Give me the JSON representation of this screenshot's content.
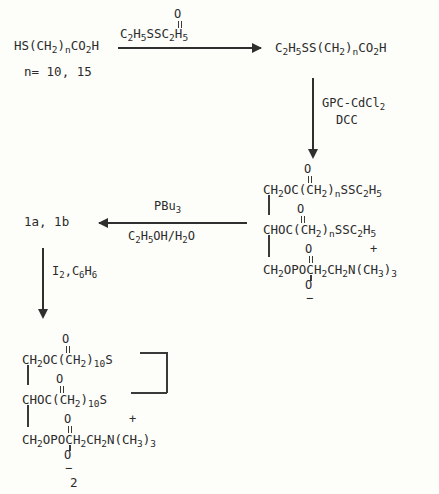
{
  "scheme": {
    "background_color": "#fdfdfa",
    "ink_color": "#2b2b2b",
    "compound_label": "2"
  },
  "step1": {
    "reactant": "HS(CH₂)ₙCO₂H",
    "reactant_note": "n= 10, 15",
    "reagent_above": "C₂H₅SSC₂H₅",
    "reagent_above_carbonyl": "O",
    "product": "C₂H₅SS(CH₂)ₙCO₂H",
    "arrow": "right-arrow"
  },
  "step2": {
    "reagent_line1": "GPC-CdCl₂",
    "reagent_line2": "DCC",
    "arrow": "down-arrow"
  },
  "intermediate": {
    "line1": "CH₂OC(CH₂)ₙSSC₂H₅",
    "line1_carbonyl": "O",
    "line2": "CHOC(CH₂)ₙSSC₂H₅",
    "line2_carbonyl": "O",
    "line3": "CH₂OPOCH₂CH₂N(CH₃)₃",
    "line3_top_o": "O",
    "line3_bottom_o": "O",
    "phosphate_charge": "−",
    "ammonium_charge": "+"
  },
  "step3": {
    "reagent_above": "PBu₃",
    "reagent_below": "C₂H₅OH/H₂O",
    "product": "1a, 1b",
    "arrow": "left-arrow"
  },
  "step4": {
    "reagent": "I₂,C₆H₆",
    "arrow": "down-arrow"
  },
  "final": {
    "line1": "CH₂OC(CH₂)₁₀S",
    "line1_carbonyl": "O",
    "line2": "CHOC(CH₂)₁₀S",
    "line2_carbonyl": "O",
    "line3": "CH₂OPOCH₂CH₂N(CH₃)₃",
    "line3_top_o": "O",
    "line3_bottom_o": "O",
    "phosphate_charge": "−",
    "ammonium_charge": "+",
    "disulfide_bridge": "S-S bridge"
  }
}
